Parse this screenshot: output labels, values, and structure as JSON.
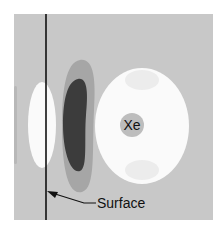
{
  "figure": {
    "labels": {
      "atom": "Xe",
      "surface": "Surface"
    },
    "colors": {
      "background": "#c8c8c8",
      "lobe_white": "#fafafa",
      "lobe_mid_gray": "#a6a6a6",
      "lobe_dark": "#3c3c3c",
      "atom_core": "#bdbdbd",
      "surface_line": "#111111"
    },
    "regions": [
      {
        "name": "far-left-faint-band",
        "shade": "light-gray"
      },
      {
        "name": "left-white-lobe",
        "shade": "white"
      },
      {
        "name": "outer-gray-lobe",
        "shade": "mid-gray"
      },
      {
        "name": "inner-dark-lobe",
        "shade": "dark"
      },
      {
        "name": "xe-white-shell",
        "shade": "white"
      },
      {
        "name": "xe-core",
        "shade": "gray"
      }
    ]
  }
}
